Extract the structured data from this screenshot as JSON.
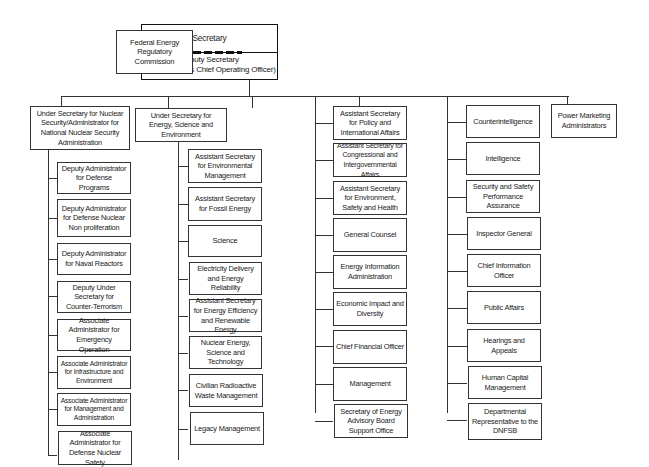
{
  "top": {
    "secretary": "Secretary",
    "deputy_secretary": "Deputy Secretary",
    "deputy_note": "(also serves as Chief Operating Officer)",
    "ferc": "Federal Energy Regulatory Commission"
  },
  "columns": [
    {
      "head": "Under Secretary for Nuclear Security/Administrator for National Nuclear Security Administration",
      "items": [
        "Deputy Administrator for Defense Programs",
        "Deputy Administrator for Defense Nuclear Non proliferation",
        "Deputy Administrator for Naval Reactors",
        "Deputy Under Secretary for Counter-Terrorism",
        "Associate Administrator for Emergency Operation",
        "Associate Administrator for Infrastructure and Environment",
        "Associate Administrator for Management and Administration",
        "Associate Administrator for Defense Nuclear Safety"
      ]
    },
    {
      "head": "Under Secretary for Energy, Science and Environment",
      "items": [
        "Assistant Secretary for Environmental Management",
        "Assistant Secretary for Fossil Energy",
        "Science",
        "Electricity Delivery and Energy Reliability",
        "Assistant Secretary for Energy Efficiency and Renewable Energy",
        "Nuclear Energy, Science and Technology",
        "Civilian Radioactive Waste Management",
        "Legacy Management"
      ]
    },
    {
      "head": "",
      "items": [
        "Assistant Secretary for Policy and International Affairs",
        "Assistant Secretary for Congressional and Intergovernmental Affairs",
        "Assistant Secretary for Environment, Safety and Health",
        "General Counsel",
        "Energy Information Administration",
        "Economic Impact and Diversity",
        "Chief Financial Officer",
        "Management",
        "Secretary of Energy Advisory Board Support Office"
      ]
    },
    {
      "head": "",
      "items": [
        "Counterintelligence",
        "Intelligence",
        "Security and Safety Performance Assurance",
        "Inspector General",
        "Chief Information Officer",
        "Public Affairs",
        "Hearings and Appeals",
        "Human Capital Management",
        "Departmental Representative to the DNFSB"
      ]
    },
    {
      "head": "Power Marketing Administrators",
      "items": []
    }
  ]
}
